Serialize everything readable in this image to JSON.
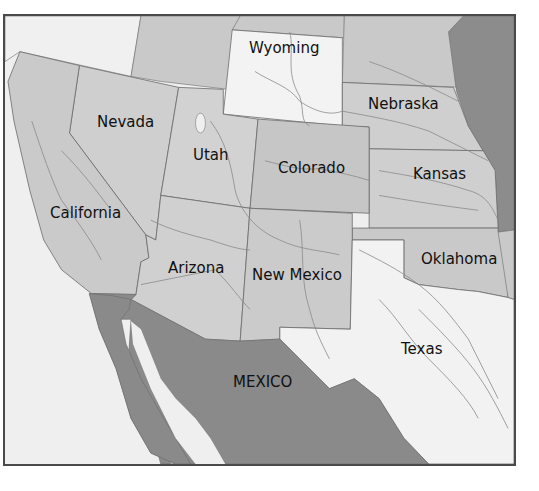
{
  "map": {
    "colors": {
      "ocean": "#efefef",
      "region_light": "#f3f3f3",
      "region_mid": "#cdcdcd",
      "region_dark_us": "#c3c3c3",
      "mexico": "#8a8a8a",
      "east_border_strip": "#8c8c8c",
      "border_line": "#6a6a6a",
      "river": "#8a8a8a",
      "frame": "#4a4a4a"
    },
    "labels": {
      "wyoming": "Wyoming",
      "nebraska": "Nebraska",
      "nevada": "Nevada",
      "utah": "Utah",
      "colorado": "Colorado",
      "kansas": "Kansas",
      "california": "California",
      "arizona": "Arizona",
      "new_mexico": "New Mexico",
      "oklahoma": "Oklahoma",
      "texas": "Texas",
      "mexico": "MEXICO"
    }
  }
}
